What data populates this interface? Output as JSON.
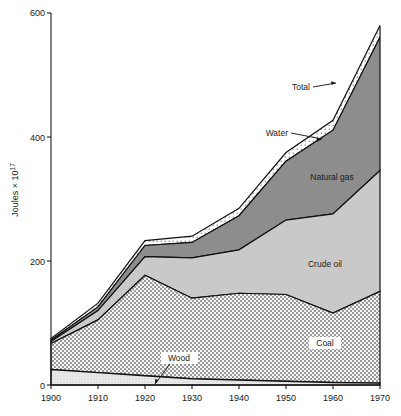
{
  "chart_data": {
    "type": "area",
    "title": "",
    "subtitle": "",
    "xlabel": "",
    "ylabel": "Joules × 10",
    "ylabel_exponent": "17",
    "xlim": [
      1900,
      1970
    ],
    "ylim": [
      0,
      600
    ],
    "grid": false,
    "legend_position": "inline-annotations",
    "stacked": true,
    "x": [
      1900,
      1910,
      1920,
      1930,
      1940,
      1950,
      1960,
      1970
    ],
    "xticks": [
      "1900",
      "1910",
      "1920",
      "1930",
      "1940",
      "1950",
      "1960",
      "1970"
    ],
    "yticks": [
      "0",
      "200",
      "400",
      "600"
    ],
    "series": [
      {
        "name": "Wood",
        "fill": "#e8e8e8",
        "pattern": "fine-dots",
        "values": [
          25,
          20,
          15,
          10,
          8,
          6,
          4,
          3
        ]
      },
      {
        "name": "Coal",
        "fill": "#d2d2d2",
        "pattern": "cross-hatch",
        "values": [
          42,
          85,
          162,
          130,
          140,
          140,
          112,
          148
        ]
      },
      {
        "name": "Crude oil",
        "fill": "#c8c8c8",
        "pattern": "solid-light",
        "values": [
          3,
          15,
          30,
          65,
          70,
          120,
          160,
          195
        ]
      },
      {
        "name": "Natural gas",
        "fill": "#8d8d8d",
        "pattern": "solid-dark",
        "values": [
          2,
          6,
          18,
          25,
          55,
          95,
          135,
          215
        ]
      },
      {
        "name": "Water",
        "fill": "#f2f2f2",
        "pattern": "sparse-dots",
        "values": [
          3,
          6,
          8,
          10,
          12,
          14,
          16,
          19
        ]
      }
    ],
    "totals": [
      75,
      132,
      233,
      240,
      285,
      375,
      427,
      580
    ],
    "annotations": [
      {
        "label": "Total",
        "x": 1952,
        "y": 505,
        "leader": true
      },
      {
        "label": "Water",
        "x": 1943,
        "y": 400,
        "leader": true
      },
      {
        "label": "Natural gas",
        "x": 1952,
        "y": 345,
        "leader": false
      },
      {
        "label": "Crude oil",
        "x": 1951,
        "y": 200,
        "leader": false
      },
      {
        "label": "Coal",
        "x": 1955,
        "y": 58,
        "leader": false,
        "boxed": true
      },
      {
        "label": "Wood",
        "x": 1924,
        "y": 35,
        "leader": true,
        "boxed": true
      }
    ]
  },
  "axes": {
    "y_tick_600": "600",
    "y_tick_400": "400",
    "y_tick_200": "200",
    "y_tick_0": "0",
    "x_tick_1900": "1900",
    "x_tick_1910": "1910",
    "x_tick_1920": "1920",
    "x_tick_1930": "1930",
    "x_tick_1940": "1940",
    "x_tick_1950": "1950",
    "x_tick_1960": "1960",
    "x_tick_1970": "1970",
    "y_axis_label": "Joules × 10",
    "y_axis_exponent": "17"
  },
  "labels": {
    "total": "Total",
    "water": "Water",
    "natural_gas": "Natural gas",
    "crude_oil": "Crude oil",
    "coal": "Coal",
    "wood": "Wood"
  },
  "colors": {
    "axis": "#1a1a1a",
    "wood": "#e8e8e8",
    "coal": "#d2d2d2",
    "crude_oil": "#c9c9c9",
    "natural_gas": "#8d8d8d",
    "water": "#f2f2f2",
    "background": "#ffffff"
  }
}
